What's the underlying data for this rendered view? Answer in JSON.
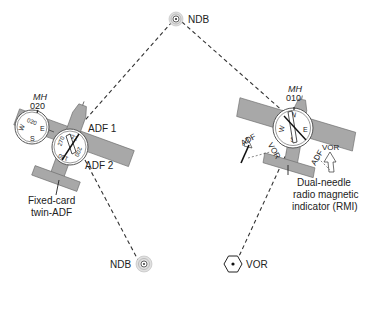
{
  "stations": {
    "ndb_top": {
      "label": "NDB",
      "type": "ndb"
    },
    "ndb_bottom": {
      "label": "NDB",
      "type": "ndb"
    },
    "vor_bottom": {
      "label": "VOR",
      "type": "vor"
    }
  },
  "left_aircraft": {
    "heading_label": "MH",
    "heading_value": "020",
    "compass": {
      "top": "020",
      "east": "E",
      "south": "S",
      "west": "W"
    },
    "adf_dial": {
      "marks": [
        "270",
        "021",
        "200",
        "180"
      ]
    },
    "needle_labels": {
      "adf1": "ADF 1",
      "adf2": "ADF 2"
    },
    "caption_line1": "Fixed-card",
    "caption_line2": "twin-ADF"
  },
  "right_aircraft": {
    "heading_label": "MH",
    "heading_value": "010",
    "rmi_dial": {
      "north": "N",
      "east": "E",
      "west": "W",
      "south": "S"
    },
    "needle_labels": {
      "adf_left": "ADF",
      "vor_left": "VOR",
      "adf_right": "ADF",
      "vor_right": "VOR"
    },
    "caption_line1": "Dual-needle",
    "caption_line2": "radio magnetic",
    "caption_line3": "indicator (RMI)"
  },
  "colors": {
    "aircraft_fill": "#a8a8a8",
    "line": "#333333",
    "text": "#222222"
  }
}
